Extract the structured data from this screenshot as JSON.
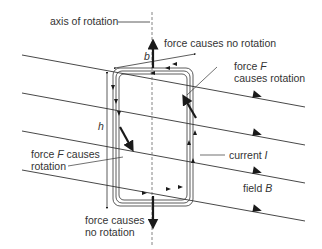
{
  "labels": {
    "axis": "axis of rotation",
    "top_force": "force causes no rotation",
    "b": "b",
    "h": "h",
    "force_right_line1_prefix": "force ",
    "force_right_line1_var": "F",
    "force_right_line2": "causes rotation",
    "force_left_line1_prefix": "force ",
    "force_left_line1_var": "F",
    "force_left_line1_suffix": " causes",
    "force_left_line2": "rotation",
    "current_prefix": "current ",
    "current_var": "I",
    "field_prefix": "field ",
    "field_var": "B",
    "bottom_force_line1": "force causes",
    "bottom_force_line2": "no rotation"
  },
  "colors": {
    "line": "#333333",
    "arrow": "#1a1a1a",
    "axis": "#666666"
  }
}
